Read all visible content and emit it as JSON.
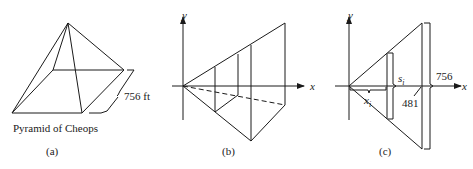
{
  "panels": [
    {
      "id": "a",
      "caption": "(a)",
      "title": "Pyramid of Cheops",
      "dimension_label": "756 ft"
    },
    {
      "id": "b",
      "caption": "(b)",
      "x_axis_label": "x",
      "y_axis_label": "y"
    },
    {
      "id": "c",
      "caption": "(c)",
      "x_axis_label": "x",
      "y_axis_label": "y",
      "slice_side_label": "s",
      "slice_side_subscript": "i",
      "slice_position_label": "x",
      "slice_position_subscript": "i",
      "height_label": "481",
      "base_label": "756"
    }
  ],
  "colors": {
    "stroke": "#1a1a1a",
    "background": "#ffffff"
  }
}
